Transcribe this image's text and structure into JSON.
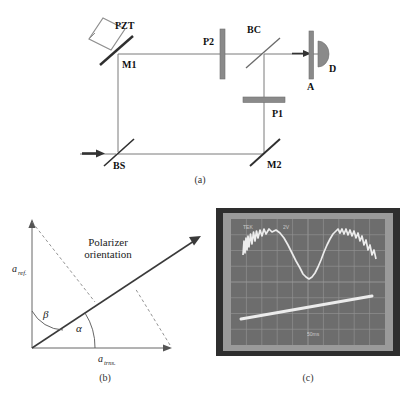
{
  "figure": {
    "caption_a": "(a)",
    "caption_b": "(b)",
    "caption_c": "(c)",
    "background_color": "#ffffff",
    "line_color": "#6e6e6e",
    "component_color": "#8a8a8a",
    "text_color": "#111111"
  },
  "panel_a": {
    "title": "Interferometer optical layout",
    "components": [
      {
        "id": "PZT",
        "label": "PZT",
        "type": "piezo-diamond",
        "x": 106,
        "y": 30
      },
      {
        "id": "M1",
        "label": "M1",
        "type": "mirror-diagonal",
        "x": 118,
        "y": 52
      },
      {
        "id": "P2",
        "label": "P2",
        "type": "polarizer-vertical-bar",
        "x": 223,
        "y": 55
      },
      {
        "id": "BC",
        "label": "BC",
        "type": "beam-combiner-diagonal",
        "x": 261,
        "y": 52
      },
      {
        "id": "A",
        "label": "A",
        "type": "aperture-vertical-bar",
        "x": 312,
        "y": 55
      },
      {
        "id": "D",
        "label": "D",
        "type": "detector-semicircle",
        "x": 328,
        "y": 52
      },
      {
        "id": "P1",
        "label": "P1",
        "type": "polarizer-horizontal-bar",
        "x": 263,
        "y": 100
      },
      {
        "id": "BS",
        "label": "BS",
        "type": "beamsplitter-diagonal",
        "x": 118,
        "y": 154
      },
      {
        "id": "M2",
        "label": "M2",
        "type": "mirror-diagonal",
        "x": 263,
        "y": 154
      }
    ],
    "labels": {
      "pzt": "PZT",
      "m1": "M1",
      "p2": "P2",
      "bc": "BC",
      "a": "A",
      "d": "D",
      "p1": "P1",
      "bs": "BS",
      "m2": "M2"
    },
    "beam_paths": [
      "input-arrow-into-BS",
      "BS-up-to-M1",
      "M1-right-to-P2-to-BC",
      "BS-right-to-M2",
      "M2-up-through-P1-to-BC",
      "BC-right-through-A-to-D"
    ]
  },
  "panel_b": {
    "title": "Polarizer orientation vector diagram",
    "labels": {
      "a_ref_base": "a",
      "a_ref_sub": "ref.",
      "a_trns_base": "a",
      "a_trns_sub": "trns.",
      "alpha": "α",
      "beta": "β",
      "polarizer_line1": "Polarizer",
      "polarizer_line2": "orientation"
    },
    "vectors": [
      {
        "name": "a_ref.",
        "direction": "vertical-up",
        "from": [
          28,
          348
        ],
        "to": [
          28,
          222
        ]
      },
      {
        "name": "a_trns.",
        "direction": "horizontal-right",
        "from": [
          28,
          348
        ],
        "to": [
          172,
          348
        ]
      },
      {
        "name": "polarizer orientation",
        "direction": "diagonal-up-right",
        "from": [
          28,
          348
        ],
        "to": [
          198,
          238
        ]
      }
    ],
    "angles": [
      {
        "name": "alpha",
        "between": "polarizer-and-horizontal",
        "approx_deg": 33
      },
      {
        "name": "beta",
        "between": "vertical-and-polarizer",
        "approx_deg": 57
      }
    ],
    "dashed_construction_lines": 2
  },
  "panel_c": {
    "title": "Oscilloscope photograph",
    "frame_color": "#3a3a3a",
    "screen_color": "#6b6b6b",
    "trace_color": "#e6e6e6",
    "grid_divisions_x": 10,
    "grid_divisions_y": 8,
    "annotations": {
      "top_left": "TEK",
      "top_center": "2V",
      "bottom_center": "50ms"
    },
    "traces": [
      {
        "name": "interference-fringe-sine",
        "type": "noisy-sine",
        "cycles": 2,
        "amplitude_div": 2.1
      },
      {
        "name": "pzt-ramp",
        "type": "linear-ramp",
        "slope_div": 1.0
      }
    ]
  }
}
